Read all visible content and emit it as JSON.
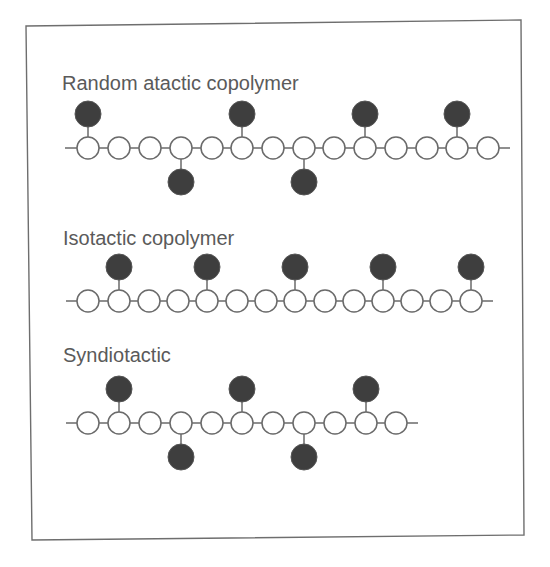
{
  "colors": {
    "frame": "#6e6e6e",
    "line": "#6a6a6a",
    "open_node_fill": "#ffffff",
    "filled_node": "#3e3e3e",
    "label_text": "#5a5a5a"
  },
  "frame": {
    "points": "26,26 521,20 524,535 32,540"
  },
  "node_radius": 11,
  "pendant_radius": 13,
  "rows": [
    {
      "id": "random-atactic",
      "label": "Random atactic copolymer",
      "label_x": 62,
      "label_y": 90,
      "chain_y": 148,
      "line_x1": 65,
      "line_x2": 510,
      "nodes": [
        88,
        119,
        150,
        181,
        212,
        242,
        273,
        304,
        334,
        365,
        396,
        427,
        457,
        488
      ],
      "pendants": [
        {
          "x": 88,
          "dir": "up"
        },
        {
          "x": 181,
          "dir": "down"
        },
        {
          "x": 242,
          "dir": "up"
        },
        {
          "x": 304,
          "dir": "down"
        },
        {
          "x": 365,
          "dir": "up"
        },
        {
          "x": 457,
          "dir": "up"
        }
      ]
    },
    {
      "id": "isotactic",
      "label": "Isotactic copolymer",
      "label_x": 63,
      "label_y": 245,
      "chain_y": 301,
      "line_x1": 66,
      "line_x2": 493,
      "nodes": [
        88,
        119,
        149,
        178,
        207,
        237,
        266,
        295,
        325,
        354,
        383,
        412,
        441,
        471
      ],
      "pendants": [
        {
          "x": 119,
          "dir": "up"
        },
        {
          "x": 207,
          "dir": "up"
        },
        {
          "x": 295,
          "dir": "up"
        },
        {
          "x": 383,
          "dir": "up"
        },
        {
          "x": 471,
          "dir": "up"
        }
      ]
    },
    {
      "id": "syndiotactic",
      "label": "Syndiotactic",
      "label_x": 63,
      "label_y": 362,
      "chain_y": 423,
      "line_x1": 66,
      "line_x2": 418,
      "nodes": [
        88,
        119,
        150,
        181,
        212,
        242,
        273,
        304,
        335,
        366,
        396
      ],
      "pendants": [
        {
          "x": 119,
          "dir": "up"
        },
        {
          "x": 181,
          "dir": "down"
        },
        {
          "x": 242,
          "dir": "up"
        },
        {
          "x": 304,
          "dir": "down"
        },
        {
          "x": 366,
          "dir": "up"
        }
      ]
    }
  ]
}
